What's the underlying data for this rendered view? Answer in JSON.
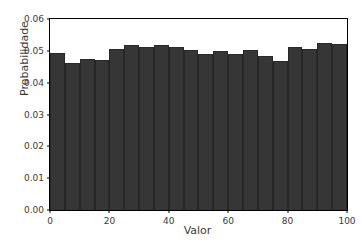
{
  "chart_data": {
    "type": "bar",
    "title": "",
    "subtitle": "",
    "xlabel": "Valor",
    "ylabel": "Probabilidade",
    "xlim": [
      0,
      100
    ],
    "ylim": [
      0,
      0.06
    ],
    "grid": false,
    "legend": null,
    "bin_width": 5,
    "bar_color": "#363636",
    "edge_color": "#262626",
    "background_color": "#ffffff",
    "axis_color": "#000000",
    "text_color": "#3a3a3a",
    "xticks": [
      "0",
      "20",
      "40",
      "60",
      "80",
      "100"
    ],
    "xtick_values": [
      0,
      20,
      40,
      60,
      80,
      100
    ],
    "yticks": [
      "0.00",
      "0.01",
      "0.02",
      "0.03",
      "0.04",
      "0.05",
      "0.06"
    ],
    "ytick_values": [
      0.0,
      0.01,
      0.02,
      0.03,
      0.04,
      0.05,
      0.06
    ],
    "categories": [
      "0-5",
      "5-10",
      "10-15",
      "15-20",
      "20-25",
      "25-30",
      "30-35",
      "35-40",
      "40-45",
      "45-50",
      "50-55",
      "55-60",
      "60-65",
      "65-70",
      "70-75",
      "75-80",
      "80-85",
      "85-90",
      "90-95",
      "95-100"
    ],
    "bin_centers": [
      2.5,
      7.5,
      12.5,
      17.5,
      22.5,
      27.5,
      32.5,
      37.5,
      42.5,
      47.5,
      52.5,
      57.5,
      62.5,
      67.5,
      72.5,
      77.5,
      82.5,
      87.5,
      92.5,
      97.5
    ],
    "values": [
      0.0494,
      0.0462,
      0.0474,
      0.047,
      0.0505,
      0.0518,
      0.0513,
      0.0518,
      0.0512,
      0.0503,
      0.0489,
      0.05,
      0.0491,
      0.0503,
      0.0484,
      0.0468,
      0.0511,
      0.0507,
      0.0524,
      0.0523
    ]
  }
}
